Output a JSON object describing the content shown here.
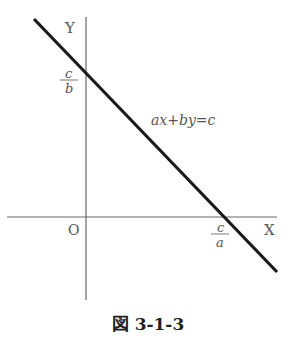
{
  "figure": {
    "caption": "図 3-1-3",
    "axes": {
      "x_label": "X",
      "y_label": "Y",
      "origin_label": "O"
    },
    "line": {
      "equation": "ax+by=c",
      "y_intercept": {
        "numerator": "c",
        "denominator": "b"
      },
      "x_intercept": {
        "numerator": "c",
        "denominator": "a"
      }
    },
    "colors": {
      "axis": "#666666",
      "line": "#1a1a1a",
      "label": "#555555"
    }
  }
}
